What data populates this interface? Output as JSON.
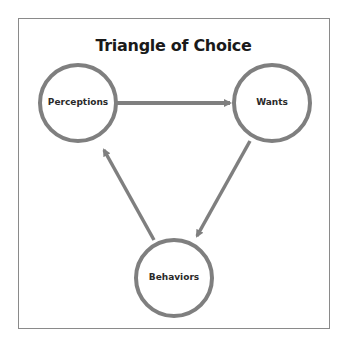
{
  "title": "Triangle of Choice",
  "nodes": [
    {
      "id": "perceptions",
      "label": "Perceptions"
    },
    {
      "id": "wants",
      "label": "Wants"
    },
    {
      "id": "behaviors",
      "label": "Behaviors"
    }
  ],
  "edges": [
    {
      "from": "perceptions",
      "to": "wants"
    },
    {
      "from": "wants",
      "to": "behaviors"
    },
    {
      "from": "behaviors",
      "to": "perceptions"
    }
  ],
  "colors": {
    "stroke": "#7f7f7f",
    "text": "#1a1a1a",
    "border": "#8a8a8a"
  }
}
